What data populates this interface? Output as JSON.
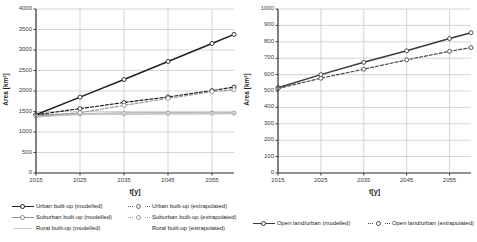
{
  "figure": {
    "background": "#ffffff",
    "panels": 2
  },
  "chart_data": [
    {
      "id": "left",
      "type": "line",
      "title": "",
      "xlabel": "t[y]",
      "ylabel": "Area [km²]",
      "xlim": [
        2015,
        2060
      ],
      "ylim": [
        0,
        4000
      ],
      "ytick_labels": [
        "0",
        "500",
        "1000",
        "1500",
        "2000",
        "2500",
        "3000",
        "3500",
        "4000"
      ],
      "ytick_values": [
        0,
        500,
        1000,
        1500,
        2000,
        2500,
        3000,
        3500,
        4000
      ],
      "xtick_labels": [
        "2015",
        "2025",
        "2035",
        "2045",
        "2055"
      ],
      "xtick_values": [
        2015,
        2025,
        2035,
        2045,
        2055
      ],
      "grid": "horizontal-and-vertical",
      "legend_position": "bottom",
      "x": [
        2015,
        2025,
        2035,
        2045,
        2055,
        2060
      ],
      "series": [
        {
          "name": "Urban built-up (modelled)",
          "style": "solid",
          "color": "#231f20",
          "marker": "open-circle",
          "values": [
            1420,
            1850,
            2280,
            2720,
            3160,
            3380
          ]
        },
        {
          "name": "Suburban built-up (modelled)",
          "style": "solid",
          "color": "#8c8c8c",
          "marker": "open-circle",
          "values": [
            1400,
            1440,
            1450,
            1455,
            1460,
            1462
          ]
        },
        {
          "name": "Rural built-up (modelled)",
          "style": "solid",
          "color": "#c8c8c8",
          "marker": "none",
          "values": [
            1380,
            1430,
            1448,
            1452,
            1458,
            1460
          ]
        },
        {
          "name": "Urban built-up (extrapolated)",
          "style": "dashed",
          "color": "#231f20",
          "marker": "open-circle",
          "values": [
            1420,
            1570,
            1720,
            1855,
            2010,
            2095
          ]
        },
        {
          "name": "Suburban built-up (extrapolated)",
          "style": "dashed",
          "color": "#9a9a9a",
          "marker": "open-circle",
          "values": [
            1385,
            1470,
            1650,
            1820,
            1985,
            2030
          ]
        },
        {
          "name": "Rural built-up (extrapolated)",
          "style": "none",
          "color": "#c8c8c8",
          "marker": "none",
          "values": [
            1380,
            1430,
            1448,
            1452,
            1458,
            1460
          ]
        }
      ],
      "legend_entries": [
        {
          "label": "Urban built-up (modelled)",
          "key": "solid-marker",
          "color": "#231f20"
        },
        {
          "label": "Suburban built-up (modelled)",
          "key": "solid-marker",
          "color": "#8c8c8c"
        },
        {
          "label": "Rural built-up (modelled)",
          "key": "solid-plain",
          "color": "#c8c8c8"
        },
        {
          "label": "Urban built-up (extrapolated)",
          "key": "dashed-marker",
          "color": "#6e6e6e"
        },
        {
          "label": "Suburban built-up (extrapolated)",
          "key": "dashed-marker",
          "color": "#9a9a9a"
        },
        {
          "label": "Rural built-up (extrapolated)",
          "key": "none",
          "color": "#c8c8c8"
        }
      ]
    },
    {
      "id": "right",
      "type": "line",
      "title": "",
      "xlabel": "t[y]",
      "ylabel": "Area [km²]",
      "xlim": [
        2015,
        2060
      ],
      "ylim": [
        0,
        1000
      ],
      "ytick_labels": [
        "0",
        "100",
        "200",
        "300",
        "400",
        "500",
        "600",
        "700",
        "800",
        "900",
        "1000"
      ],
      "ytick_values": [
        0,
        100,
        200,
        300,
        400,
        500,
        600,
        700,
        800,
        900,
        1000
      ],
      "xtick_labels": [
        "2015",
        "2025",
        "2035",
        "2045",
        "2055"
      ],
      "xtick_values": [
        2015,
        2025,
        2035,
        2045,
        2055
      ],
      "grid": "horizontal-and-vertical",
      "legend_position": "bottom",
      "x": [
        2015,
        2025,
        2035,
        2045,
        2055,
        2060
      ],
      "series": [
        {
          "name": "Open land/urban (modelled)",
          "style": "solid",
          "color": "#3a3a3a",
          "marker": "open-circle",
          "values": [
            520,
            600,
            675,
            745,
            820,
            855
          ]
        },
        {
          "name": "Open land/urban (extrapolated)",
          "style": "dashed",
          "color": "#4a4a4a",
          "marker": "open-circle",
          "values": [
            515,
            578,
            633,
            690,
            742,
            765
          ]
        }
      ],
      "legend_entries": [
        {
          "label": "Open land/urban (modelled)",
          "key": "solid-marker",
          "color": "#3a3a3a"
        },
        {
          "label": "Open land/urban (extrapolated)",
          "key": "dashed-marker",
          "color": "#4a4a4a"
        }
      ]
    }
  ]
}
